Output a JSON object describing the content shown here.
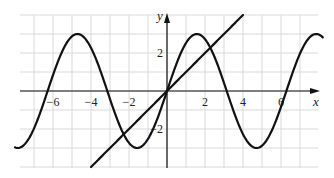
{
  "chart_data": {
    "type": "line",
    "title": "",
    "xlabel": "x",
    "ylabel": "y",
    "xlim": [
      -8.0,
      8.2
    ],
    "ylim": [
      -4.1,
      4.0
    ],
    "grid": true,
    "x_tick_labels": [
      "−6",
      "−4",
      "−2",
      "2",
      "4",
      "6"
    ],
    "x_ticks": [
      -6,
      -4,
      -2,
      2,
      4,
      6
    ],
    "y_tick_labels": [
      "2",
      "−2"
    ],
    "y_ticks": [
      2,
      -2
    ],
    "series": [
      {
        "name": "y = 3 sin x",
        "function": "3*sin(x)",
        "x_range": [
          -8.0,
          8.2
        ],
        "x": [
          -8,
          -6.28,
          -4.71,
          -3.14,
          -1.57,
          0,
          1.57,
          3.14,
          4.71,
          6.28,
          8
        ],
        "y": [
          -2.97,
          0,
          3,
          0,
          -3,
          0,
          3,
          0,
          -3,
          0,
          2.97
        ]
      },
      {
        "name": "y = x",
        "function": "x",
        "x_range": [
          -4.0,
          4.0
        ],
        "x": [
          -4,
          0,
          4
        ],
        "y": [
          -4,
          0,
          4
        ]
      }
    ],
    "intersections": [
      [
        -2.28,
        -2.28
      ],
      [
        0,
        0
      ],
      [
        2.28,
        2.28
      ]
    ],
    "colors": {
      "curve": "#111111",
      "grid": "#d9d9d9",
      "axis": "#111111"
    }
  }
}
